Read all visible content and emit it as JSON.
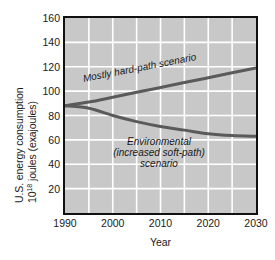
{
  "chart_data": {
    "type": "line",
    "title": "",
    "xlabel": "Year",
    "ylabel_line1": "U.S. energy consumption",
    "ylabel_line2_pre": "10",
    "ylabel_line2_sup": "18",
    "ylabel_line2_post": " joules (exajoules)",
    "ylabel_full": "U.S. energy consumption 10^18 joules (exajoules)",
    "xlim": [
      1990,
      2030
    ],
    "ylim": [
      0,
      160
    ],
    "xticks": [
      1990,
      2000,
      2010,
      2020,
      2030
    ],
    "xticklabels": [
      "1990",
      "2000",
      "2010",
      "2020",
      "2030"
    ],
    "yticks": [
      20,
      40,
      60,
      80,
      100,
      120,
      140,
      160
    ],
    "yticklabels": [
      "20",
      "40",
      "60",
      "80",
      "100",
      "120",
      "140",
      "160"
    ],
    "grid": true,
    "grid_color": "#ffffff",
    "grid_x_step": 5,
    "grid_y_step": 20,
    "plot_background": "#c8c8c8",
    "axis_color": "#111111",
    "line_color": "#5a5a5a",
    "legend_position": "inline-annotations",
    "series": [
      {
        "name": "Mostly hard-path scenario",
        "annotation": "Mostly hard-path scenario",
        "x": [
          1990,
          1995,
          2000,
          2005,
          2010,
          2015,
          2020,
          2025,
          2030
        ],
        "values": [
          88,
          91,
          95,
          99,
          103,
          107,
          111,
          115,
          119
        ]
      },
      {
        "name": "Environmental (increased soft-path) scenario",
        "annotation_line1": "Environmental",
        "annotation_line2": "(increased soft-path)",
        "annotation_line3": "scenario",
        "x": [
          1990,
          1995,
          2000,
          2005,
          2010,
          2015,
          2020,
          2025,
          2030
        ],
        "values": [
          88,
          86,
          80,
          75,
          71,
          68,
          65,
          63.5,
          63
        ]
      }
    ]
  }
}
